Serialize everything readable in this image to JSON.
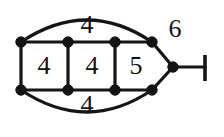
{
  "figure": {
    "background_color": "#ffffff",
    "ink_color": "#151515",
    "width": 224,
    "height": 137
  },
  "labels": {
    "top_face": "4",
    "left_face": "4",
    "middle_face": "4",
    "right_face": "5",
    "bottom_face": "4",
    "outer_face": "6"
  },
  "label_positions": {
    "top_face": {
      "x": 87,
      "y": 27
    },
    "left_face": {
      "x": 44,
      "y": 68
    },
    "middle_face": {
      "x": 92,
      "y": 68
    },
    "right_face": {
      "x": 136,
      "y": 68
    },
    "bottom_face": {
      "x": 87,
      "y": 107
    },
    "outer_face": {
      "x": 175,
      "y": 31
    }
  },
  "graph": {
    "vertices": [
      {
        "id": "v-top-left",
        "x": 21,
        "y": 42
      },
      {
        "id": "v-top-mid1",
        "x": 68,
        "y": 42
      },
      {
        "id": "v-top-mid2",
        "x": 115,
        "y": 42
      },
      {
        "id": "v-top-right",
        "x": 152,
        "y": 42
      },
      {
        "id": "v-bottom-left",
        "x": 21,
        "y": 90
      },
      {
        "id": "v-bottom-mid1",
        "x": 68,
        "y": 90
      },
      {
        "id": "v-bottom-mid2",
        "x": 115,
        "y": 90
      },
      {
        "id": "v-bottom-right",
        "x": 152,
        "y": 90
      },
      {
        "id": "v-apex",
        "x": 173,
        "y": 67
      }
    ],
    "vertex_radius": 5.2,
    "straight_edges": [
      {
        "id": "edge-top-rail",
        "x1": 21,
        "y1": 42,
        "x2": 152,
        "y2": 42
      },
      {
        "id": "edge-bottom-rail",
        "x1": 21,
        "y1": 90,
        "x2": 152,
        "y2": 90
      },
      {
        "id": "edge-rung-left",
        "x1": 21,
        "y1": 42,
        "x2": 21,
        "y2": 90
      },
      {
        "id": "edge-rung-mid1",
        "x1": 68,
        "y1": 42,
        "x2": 68,
        "y2": 90
      },
      {
        "id": "edge-rung-mid2",
        "x1": 115,
        "y1": 42,
        "x2": 115,
        "y2": 90
      },
      {
        "id": "edge-apex-upper",
        "x1": 152,
        "y1": 42,
        "x2": 173,
        "y2": 67
      },
      {
        "id": "edge-apex-lower",
        "x1": 152,
        "y1": 90,
        "x2": 173,
        "y2": 67
      },
      {
        "id": "edge-pendant",
        "x1": 173,
        "y1": 67,
        "x2": 205,
        "y2": 67
      }
    ],
    "arcs": [
      {
        "id": "arc-top",
        "d": "M 21 42 Q 87 -2 152 42"
      },
      {
        "id": "arc-bottom",
        "d": "M 21 90 Q 87 134 152 90"
      }
    ],
    "pendant_terminal": {
      "id": "pendant-terminal-bar",
      "x": 205,
      "y1": 55,
      "y2": 81
    }
  }
}
